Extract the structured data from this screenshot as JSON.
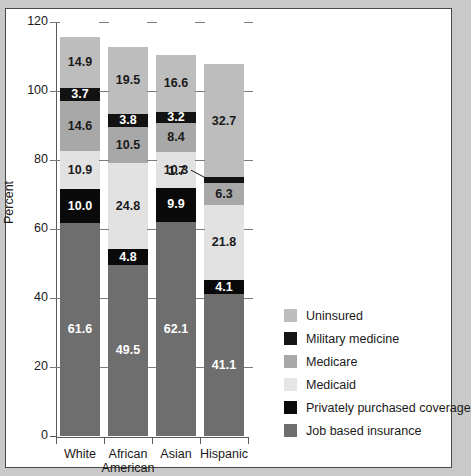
{
  "chart_data": {
    "type": "bar",
    "subtype": "stacked-bar",
    "title": "",
    "xlabel": "",
    "ylabel": "Percent",
    "ylim": [
      0,
      120
    ],
    "yticks": [
      0,
      20,
      40,
      60,
      80,
      100,
      120
    ],
    "ytick_labels": [
      "0",
      "20",
      "40",
      "60",
      "80",
      "100",
      "120"
    ],
    "grid": false,
    "legend_position": "right",
    "categories": [
      "White",
      "African American",
      "Asian",
      "Hispanic"
    ],
    "category_lines": [
      [
        "White"
      ],
      [
        "African",
        "American"
      ],
      [
        "Asian"
      ],
      [
        "Hispanic"
      ]
    ],
    "series": [
      {
        "name": "Job based insurance",
        "color": "#6e6e6e",
        "label_color": "#ffffff",
        "values": [
          61.6,
          49.5,
          62.1,
          41.1
        ],
        "labels": [
          "61.6",
          "49.5",
          "62.1",
          "41.1"
        ]
      },
      {
        "name": "Privately purchased coverage",
        "color": "#0a0a0a",
        "label_color": "#ffffff",
        "values": [
          10.0,
          4.8,
          9.9,
          4.1
        ],
        "labels": [
          "10.0",
          "4.8",
          "9.9",
          "4.1"
        ]
      },
      {
        "name": "Medicaid",
        "color": "#e2e2e2",
        "label_color": "#1a1a1a",
        "values": [
          10.9,
          24.8,
          10.3,
          21.8
        ],
        "labels": [
          "10.9",
          "24.8",
          "10.3",
          "21.8"
        ]
      },
      {
        "name": "Medicare",
        "color": "#a8a8a8",
        "label_color": "#1a1a1a",
        "values": [
          14.6,
          10.5,
          8.4,
          6.3
        ],
        "labels": [
          "14.6",
          "10.5",
          "8.4",
          "6.3"
        ]
      },
      {
        "name": "Military medicine",
        "color": "#121212",
        "label_color": "#ffffff",
        "values": [
          3.7,
          3.8,
          3.2,
          1.7
        ],
        "labels": [
          "3.7",
          "3.8",
          "3.2",
          "1.7"
        ]
      },
      {
        "name": "Uninsured",
        "color": "#bdbdbd",
        "label_color": "#1a1a1a",
        "values": [
          14.9,
          19.5,
          16.6,
          32.7
        ],
        "labels": [
          "14.9",
          "19.5",
          "16.6",
          "32.7"
        ]
      }
    ],
    "totals": [
      115.7,
      112.9,
      110.5,
      107.7
    ],
    "callout": {
      "text": "1.7",
      "series": "Military medicine",
      "category": "Hispanic"
    }
  },
  "legend": {
    "items": [
      {
        "label": "Uninsured",
        "color": "#bdbdbd"
      },
      {
        "label": "Military medicine",
        "color": "#151515"
      },
      {
        "label": "Medicare",
        "color": "#a8a8a8"
      },
      {
        "label": "Medicaid",
        "color": "#e6e6e6"
      },
      {
        "label": "Privately purchased coverage",
        "color": "#0a0a0a"
      },
      {
        "label": "Job based insurance",
        "color": "#6e6e6e"
      }
    ]
  },
  "axis": {
    "y_title": "Percent"
  }
}
